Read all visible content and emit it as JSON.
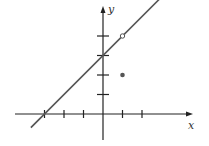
{
  "chart_data": {
    "type": "line",
    "title": "",
    "xlabel": "x",
    "ylabel": "y",
    "grid": false,
    "x_ticks": [
      -3,
      -2,
      -1,
      1,
      2
    ],
    "y_ticks": [
      1,
      2,
      3,
      4
    ],
    "tick_labels_shown": false,
    "xlim": [
      -4.1,
      4.5
    ],
    "ylim": [
      -1.6,
      5.8
    ],
    "series": [
      {
        "name": "line y = x + 3",
        "kind": "line",
        "x": [
          -3.7,
          3.4
        ],
        "y": [
          -0.7,
          6.4
        ],
        "equation": "y = x + 3",
        "color": "#555555"
      }
    ],
    "points": [
      {
        "name": "open-circle",
        "x": 1,
        "y": 4,
        "style": "open",
        "meaning": "hole in line"
      },
      {
        "name": "filled-point",
        "x": 1,
        "y": 2,
        "style": "filled"
      }
    ],
    "colors": {
      "axes": "#222222",
      "line": "#555555",
      "point": "#555555"
    }
  }
}
